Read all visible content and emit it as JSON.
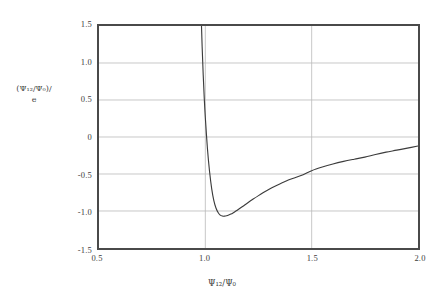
{
  "chart_data": {
    "type": "line",
    "title": "",
    "subtitle": "",
    "xlabel": "Ψ₁₂/Ψ₀",
    "ylabel_line1": "(Ψ₁₂/Ψ₀)/",
    "ylabel_line2": "e",
    "xlim": [
      0.5,
      2.0
    ],
    "ylim": [
      -1.5,
      1.5
    ],
    "grid": true,
    "legend": null,
    "xticks": [
      "0.5",
      "1.0",
      "1.5",
      "2.0"
    ],
    "xtick_values": [
      0.5,
      1.0,
      1.5,
      2.0
    ],
    "yticks": [
      "1.5",
      "1.0",
      "0.5",
      "0",
      "-0.5",
      "-1.0",
      "-1.5"
    ],
    "ytick_values": [
      1.5,
      1.0,
      0.5,
      0,
      -0.5,
      -1.0,
      -1.5
    ],
    "series": [
      {
        "name": "potential",
        "color": "#3c3c3c",
        "x": [
          0.96,
          0.965,
          0.97,
          0.975,
          0.98,
          0.985,
          0.99,
          0.995,
          1.0,
          1.01,
          1.02,
          1.03,
          1.04,
          1.05,
          1.06,
          1.07,
          1.08,
          1.09,
          1.1,
          1.11,
          1.12,
          1.13,
          1.14,
          1.15,
          1.175,
          1.2,
          1.225,
          1.25,
          1.275,
          1.3,
          1.325,
          1.35,
          1.375,
          1.4,
          1.45,
          1.5,
          1.55,
          1.6,
          1.65,
          1.7,
          1.75,
          1.8,
          1.85,
          1.9,
          1.95,
          2.0
        ],
        "y": [
          4.9,
          3.85,
          2.95,
          2.25,
          1.68,
          1.22,
          0.84,
          0.52,
          0.26,
          -0.16,
          -0.47,
          -0.7,
          -0.86,
          -0.96,
          -1.02,
          -1.055,
          -1.068,
          -1.07,
          -1.065,
          -1.055,
          -1.042,
          -1.026,
          -1.008,
          -0.989,
          -0.939,
          -0.888,
          -0.839,
          -0.792,
          -0.748,
          -0.707,
          -0.669,
          -0.634,
          -0.602,
          -0.572,
          -0.52,
          -0.455,
          -0.406,
          -0.365,
          -0.33,
          -0.3,
          -0.272,
          -0.236,
          -0.205,
          -0.178,
          -0.15,
          -0.122
        ]
      }
    ],
    "annotations": []
  }
}
